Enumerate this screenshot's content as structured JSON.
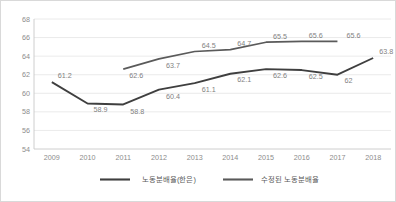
{
  "chart_data": {
    "type": "line",
    "title": "",
    "subtitle": "",
    "xlabel": "",
    "ylabel": "",
    "categories": [
      "2009",
      "2010",
      "2011",
      "2012",
      "2013",
      "2014",
      "2015",
      "2016",
      "2017",
      "2018"
    ],
    "ylim": [
      54,
      68
    ],
    "yticks": [
      54,
      56,
      58,
      60,
      62,
      64,
      66,
      68
    ],
    "ytick_labels": [
      "54",
      "56",
      "58",
      "60",
      "62",
      "64",
      "66",
      "68"
    ],
    "grid": true,
    "grid_axis": "y",
    "legend_position": "bottom",
    "series": [
      {
        "name": "노동분배율(한은)",
        "color": "#3f3f3f",
        "x": [
          "2009",
          "2010",
          "2011",
          "2012",
          "2013",
          "2014",
          "2015",
          "2016",
          "2017",
          "2018"
        ],
        "values": [
          61.2,
          58.9,
          58.8,
          60.4,
          61.1,
          62.1,
          62.6,
          62.5,
          62.0,
          63.8
        ],
        "data_labels": [
          "61.2",
          "58.9",
          "58.8",
          "60.4",
          "61.1",
          "62.1",
          "62.6",
          "62.5",
          "62",
          "63.8"
        ]
      },
      {
        "name": "수정된 노동분배율",
        "color": "#5a5a5a",
        "x": [
          "2011",
          "2012",
          "2013",
          "2014",
          "2015",
          "2016",
          "2017"
        ],
        "values": [
          62.6,
          63.7,
          64.5,
          64.7,
          65.5,
          65.6,
          65.6
        ],
        "data_labels": [
          "62.6",
          "63.7",
          "64.5",
          "64.7",
          "65.5",
          "65.6",
          "65.6"
        ]
      }
    ]
  },
  "legend": {
    "items": [
      {
        "label": "노동분배율(한은)",
        "color": "#3f3f3f"
      },
      {
        "label": "수정된 노동분배율",
        "color": "#5a5a5a"
      }
    ]
  }
}
